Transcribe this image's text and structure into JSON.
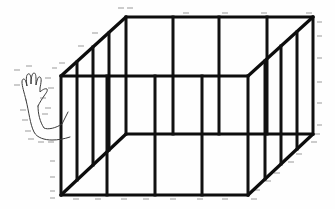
{
  "figure": {
    "colors": {
      "line": "#111111",
      "hatch": "#9a9a9a",
      "background": "#fefefe",
      "hand_outline": "#3a3a3a"
    },
    "box": {
      "front_face": {
        "left": 61,
        "right": 248,
        "top": 76,
        "bottom": 195,
        "vertical_bars_x": [
          61,
          107,
          155,
          202,
          248
        ]
      },
      "back_face": {
        "left": 126,
        "right": 313,
        "top": 17,
        "bottom": 134,
        "vertical_bars_x": [
          126,
          173,
          219,
          267,
          313
        ]
      },
      "left_side_bars_x": [
        77,
        93,
        109
      ],
      "right_side_bars_x": [
        265,
        281,
        297
      ]
    },
    "hand": {
      "pose": "waving",
      "position": "left of box"
    },
    "label": "wireframe-cage-with-hand"
  }
}
